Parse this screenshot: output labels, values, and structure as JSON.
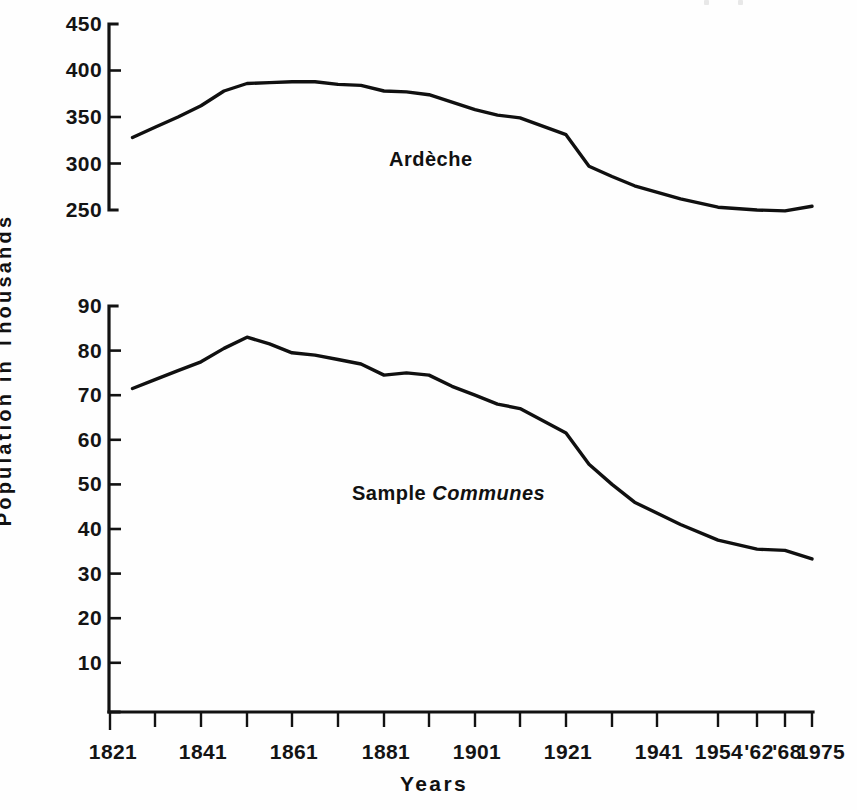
{
  "axes": {
    "ylabel": "Population in Thousands",
    "xlabel": "Years"
  },
  "top_panel": {
    "series_label": "Ardèche",
    "ytick_labels": [
      "450",
      "400",
      "350",
      "300",
      "250"
    ]
  },
  "bottom_panel": {
    "series_label_plain": "Sample",
    "series_label_emphasis": "Communes",
    "ytick_labels": [
      "90",
      "80",
      "70",
      "60",
      "50",
      "40",
      "30",
      "20",
      "10"
    ]
  },
  "xtick_labels": [
    "1821",
    "1841",
    "1861",
    "1881",
    "1901",
    "1921",
    "1941",
    "1954",
    "'62",
    "'68",
    "1975"
  ],
  "colors": {
    "line": "#101010",
    "axis": "#121212",
    "background": "#fefefe",
    "text": "#111111"
  },
  "chart_data": [
    {
      "type": "line",
      "panel": "top",
      "title": "",
      "xlabel": "Years",
      "ylabel": "Population in Thousands",
      "series_name": "Ardèche",
      "xlim": [
        1821,
        1975
      ],
      "ylim": [
        250,
        450
      ],
      "grid": false,
      "legend_position": "inline-annotation",
      "ytick_values": [
        250,
        300,
        350,
        400,
        450
      ],
      "xtick_values": [
        1821,
        1831,
        1841,
        1851,
        1861,
        1871,
        1881,
        1891,
        1901,
        1911,
        1921,
        1931,
        1941,
        1954,
        1962,
        1968,
        1975
      ],
      "xtick_labeled": [
        1821,
        1841,
        1861,
        1881,
        1901,
        1921,
        1941,
        1954,
        1962,
        1968,
        1975
      ],
      "x": [
        1826,
        1831,
        1836,
        1841,
        1846,
        1851,
        1856,
        1861,
        1866,
        1871,
        1876,
        1881,
        1886,
        1891,
        1896,
        1901,
        1906,
        1911,
        1921,
        1926,
        1931,
        1936,
        1946,
        1954,
        1962,
        1968,
        1975
      ],
      "y": [
        328,
        339,
        350,
        362,
        378,
        386,
        387,
        388,
        388,
        385,
        384,
        378,
        377,
        374,
        366,
        358,
        352,
        349,
        331,
        297,
        286,
        276,
        262,
        253,
        250,
        249,
        254
      ]
    },
    {
      "type": "line",
      "panel": "bottom",
      "title": "",
      "xlabel": "Years",
      "ylabel": "Population in Thousands",
      "series_name": "Sample Communes",
      "xlim": [
        1821,
        1975
      ],
      "ylim": [
        0,
        90
      ],
      "grid": false,
      "legend_position": "inline-annotation",
      "ytick_values": [
        10,
        20,
        30,
        40,
        50,
        60,
        70,
        80,
        90
      ],
      "xtick_values": [
        1821,
        1831,
        1841,
        1851,
        1861,
        1871,
        1881,
        1891,
        1901,
        1911,
        1921,
        1931,
        1941,
        1954,
        1962,
        1968,
        1975
      ],
      "xtick_labeled": [
        1821,
        1841,
        1861,
        1881,
        1901,
        1921,
        1941,
        1954,
        1962,
        1968,
        1975
      ],
      "x": [
        1826,
        1831,
        1836,
        1841,
        1846,
        1851,
        1856,
        1861,
        1866,
        1871,
        1876,
        1881,
        1886,
        1891,
        1896,
        1901,
        1906,
        1911,
        1921,
        1926,
        1931,
        1936,
        1946,
        1954,
        1962,
        1968,
        1975
      ],
      "y": [
        71.5,
        73.5,
        75.5,
        77.5,
        80.5,
        83,
        81.5,
        79.5,
        79,
        78,
        77,
        74.5,
        75,
        74.5,
        72,
        70,
        68,
        67,
        61.5,
        54.5,
        50,
        46,
        41,
        37.5,
        35.5,
        35.2,
        33.3
      ]
    }
  ]
}
